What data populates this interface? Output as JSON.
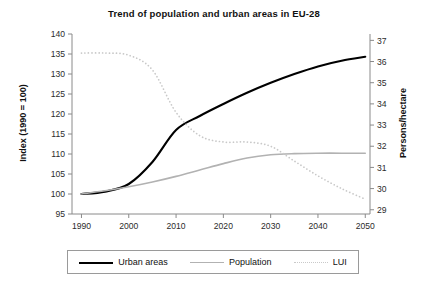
{
  "chart_data": {
    "type": "line",
    "title": "Trend of population and urban areas in EU-28",
    "xlabel": "",
    "ylabel": "Index (1990 = 100)",
    "y2label": "Persons/hectare",
    "xlim": [
      1988,
      2051
    ],
    "ylim": [
      95,
      140
    ],
    "y2lim": [
      28.8,
      37.3
    ],
    "grid": false,
    "legend_position": "bottom",
    "xticks": [
      1990,
      2000,
      2010,
      2020,
      2030,
      2040,
      2050
    ],
    "yticks": [
      95,
      100,
      105,
      110,
      115,
      120,
      125,
      130,
      135,
      140
    ],
    "y2ticks": [
      29,
      30,
      31,
      32,
      33,
      34,
      35,
      36,
      37
    ],
    "x": [
      1990,
      1995,
      2000,
      2005,
      2010,
      2015,
      2020,
      2025,
      2030,
      2035,
      2040,
      2045,
      2050
    ],
    "series": [
      {
        "name": "Urban areas",
        "axis": "left",
        "style": "solid",
        "color": "#000000",
        "width": 2.1,
        "values": [
          100.0,
          100.6,
          102.5,
          108.0,
          116.0,
          119.5,
          122.5,
          125.3,
          127.8,
          130.0,
          131.9,
          133.3,
          134.3
        ]
      },
      {
        "name": "Population",
        "axis": "left",
        "style": "solid",
        "color": "#b2b2b2",
        "width": 1.6,
        "values": [
          100.0,
          100.8,
          101.8,
          103.0,
          104.4,
          106.0,
          107.6,
          109.0,
          109.8,
          110.1,
          110.2,
          110.2,
          110.2
        ]
      },
      {
        "name": "LUI",
        "axis": "right",
        "style": "dotted",
        "color": "#c9c9c9",
        "width": 1.7,
        "values": [
          36.4,
          36.4,
          36.3,
          35.6,
          33.6,
          32.5,
          32.2,
          32.2,
          32.0,
          31.3,
          30.6,
          30.0,
          29.5
        ]
      }
    ],
    "legend": [
      {
        "label": "Urban areas",
        "swatch": "solid-black"
      },
      {
        "label": "Population",
        "swatch": "solid-gray"
      },
      {
        "label": "LUI",
        "swatch": "dotted-gray"
      }
    ]
  }
}
